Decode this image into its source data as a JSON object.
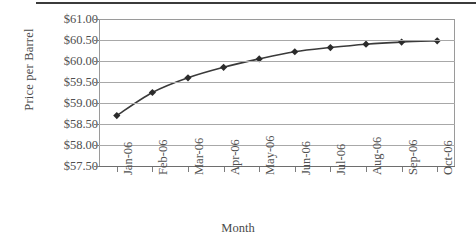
{
  "chart_data": {
    "type": "line",
    "title": "",
    "subtitle": "",
    "xlabel": "Month",
    "ylabel": "Price per Barrel",
    "categories": [
      "Jan-06",
      "Feb-06",
      "Mar-06",
      "Apr-06",
      "May-06",
      "Jun-06",
      "Jul-06",
      "Aug-06",
      "Sep-06",
      "Oct-06"
    ],
    "values": [
      58.7,
      59.25,
      59.6,
      59.85,
      60.05,
      60.22,
      60.32,
      60.4,
      60.45,
      60.48
    ],
    "series": [
      {
        "name": "Price per Barrel",
        "values": [
          58.7,
          59.25,
          59.6,
          59.85,
          60.05,
          60.22,
          60.32,
          60.4,
          60.45,
          60.48
        ]
      }
    ],
    "ylim": [
      57.5,
      61.0
    ],
    "ytick_values": [
      61.0,
      60.5,
      60.0,
      59.5,
      59.0,
      58.5,
      58.0,
      57.5
    ],
    "ytick_labels": [
      "$61.00",
      "$60.50",
      "$60.00",
      "$59.50",
      "$59.00",
      "$58.50",
      "$58.00",
      "$57.50"
    ],
    "grid": "horizontal",
    "legend": "none",
    "marker": "diamond",
    "line_color": "#3a3a3a",
    "marker_color": "#2b2b2b",
    "grid_color": "#a8a8a8",
    "axis_color": "#6e6e6e",
    "text_color": "#4f4f4f",
    "background": "#ffffff"
  }
}
